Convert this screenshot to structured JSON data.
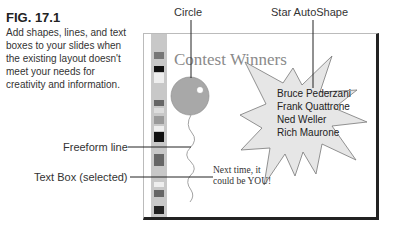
{
  "caption": {
    "figure_label": "FIG. 17.1",
    "body": "Add shapes, lines, and text boxes to your slides when the existing layout doesn't meet your needs for creativity and information."
  },
  "callouts": {
    "circle": "Circle",
    "star": "Star AutoShape",
    "freeform": "Freeform line",
    "textbox": "Text Box (selected)"
  },
  "slide": {
    "title": "Contest Winners",
    "winners": [
      "Bruce Pederzani",
      "Frank Quattrone",
      "Ned Weller",
      "Rich Maurone"
    ],
    "textbox_line1": "Next time, it",
    "textbox_line2": "could be YOU!"
  },
  "colors": {
    "circle_fill": "#a8a8a8",
    "star_fill": "#e6e6e6",
    "slide_title": "#8a8a8a",
    "strip": "#c8c8c8"
  }
}
